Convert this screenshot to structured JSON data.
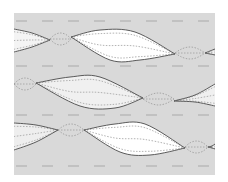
{
  "colors": {
    "background": "#ffffff",
    "panel": "#d9d9d9",
    "dash": "#a9a9a9",
    "outline": "#5a5a5a",
    "dotted": "#a0a0a0",
    "lens_fill": "#ffffff",
    "lens_fill_light": "#eeeeee"
  },
  "panel": {
    "x": 14,
    "y": 13,
    "width": 201,
    "height": 162
  },
  "dashed_lines": [
    {
      "y": 21
    },
    {
      "y": 66
    },
    {
      "y": 115
    },
    {
      "y": 166
    }
  ],
  "dash_pattern": {
    "start_x": 16,
    "dash": 11,
    "gap": 15
  },
  "ribbons": [
    {
      "name": "ribbon-1",
      "lenses": [
        {
          "x0": 14,
          "y0": 29,
          "x1": 50,
          "y1": 40,
          "top": [
            [
              14,
              29
            ],
            [
              32,
              33
            ],
            [
              50,
              40
            ]
          ],
          "bottom": [
            [
              14,
              52
            ],
            [
              32,
              47
            ],
            [
              50,
              40
            ]
          ],
          "fill": "#f4f4f4",
          "open_left": true
        },
        {
          "x0": 71,
          "y0": 37,
          "x1": 175,
          "y1": 54,
          "top": [
            [
              71,
              37
            ],
            [
              100,
              30
            ],
            [
              135,
              32
            ],
            [
              175,
              54
            ]
          ],
          "bottom": [
            [
              71,
              37
            ],
            [
              110,
              60
            ],
            [
              140,
              60
            ],
            [
              175,
              54
            ]
          ],
          "fill": "#ffffff"
        },
        {
          "x0": 205,
          "y0": 53,
          "x1": 215,
          "y1": 52,
          "top": [
            [
              205,
              53
            ],
            [
              210,
              51
            ],
            [
              215,
              49
            ]
          ],
          "bottom": [
            [
              205,
              53
            ],
            [
              210,
              54
            ],
            [
              215,
              55
            ]
          ],
          "fill": "#eeeeee",
          "open_right": true
        }
      ],
      "twists": [
        {
          "x0": 50,
          "x1": 71,
          "y": 39
        },
        {
          "x0": 175,
          "x1": 205,
          "y": 53
        }
      ]
    },
    {
      "name": "ribbon-2",
      "lenses": [
        {
          "x0": 36,
          "y0": 83,
          "x1": 143,
          "y1": 98,
          "top": [
            [
              36,
              83
            ],
            [
              70,
              77
            ],
            [
              100,
              77
            ],
            [
              143,
              98
            ]
          ],
          "bottom": [
            [
              36,
              83
            ],
            [
              80,
              106
            ],
            [
              115,
              108
            ],
            [
              143,
              98
            ]
          ],
          "fill": "#f0f0f0"
        },
        {
          "x0": 174,
          "y0": 101,
          "x1": 215,
          "y1": 95,
          "top": [
            [
              174,
              101
            ],
            [
              195,
              95
            ],
            [
              215,
              84
            ]
          ],
          "bottom": [
            [
              174,
              101
            ],
            [
              195,
              102
            ],
            [
              215,
              106
            ]
          ],
          "fill": "#f0f0f0",
          "open_right": true
        }
      ],
      "twists": [
        {
          "x0": 14,
          "x1": 36,
          "y": 84
        },
        {
          "x0": 143,
          "x1": 174,
          "y": 99
        }
      ]
    },
    {
      "name": "ribbon-3",
      "lenses": [
        {
          "x0": 14,
          "y0": 123,
          "x1": 58,
          "y1": 130,
          "top": [
            [
              14,
              123
            ],
            [
              36,
              125
            ],
            [
              58,
              130
            ]
          ],
          "bottom": [
            [
              14,
              150
            ],
            [
              36,
              142
            ],
            [
              58,
              130
            ]
          ],
          "fill": "#eeeeee",
          "open_left": true
        },
        {
          "x0": 84,
          "y0": 130,
          "x1": 185,
          "y1": 148,
          "top": [
            [
              84,
              130
            ],
            [
              115,
              124
            ],
            [
              145,
              124
            ],
            [
              185,
              148
            ]
          ],
          "bottom": [
            [
              84,
              130
            ],
            [
              120,
              152
            ],
            [
              150,
              155
            ],
            [
              185,
              148
            ]
          ],
          "fill": "#ffffff"
        },
        {
          "x0": 208,
          "y0": 147,
          "x1": 215,
          "y1": 146,
          "top": [
            [
              208,
              147
            ],
            [
              212,
              146
            ],
            [
              215,
              144
            ]
          ],
          "bottom": [
            [
              208,
              147
            ],
            [
              212,
              148
            ],
            [
              215,
              149
            ]
          ],
          "fill": "#eeeeee",
          "open_right": true
        }
      ],
      "twists": [
        {
          "x0": 58,
          "x1": 84,
          "y": 130
        },
        {
          "x0": 185,
          "x1": 208,
          "y": 147
        }
      ]
    }
  ]
}
